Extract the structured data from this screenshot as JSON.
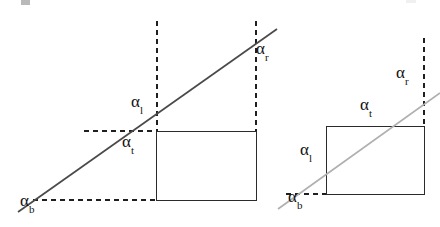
{
  "figure": {
    "background_color": "#ffffff",
    "stroke_color_dark": "#2b2b2b",
    "stroke_color_light": "#a8a8a8",
    "dash_color": "#1f1f1f",
    "label_color": "#121212",
    "alpha_glyph": "α",
    "subscripts": {
      "bottom": "b",
      "left": "l",
      "top": "t",
      "right": "r"
    },
    "panels": [
      {
        "id": "left-panel",
        "name": "line-misses-rectangle-case",
        "rectangle": {
          "x": 156,
          "y": 131,
          "width": 100,
          "height": 69
        },
        "ray": {
          "x1": 18,
          "y1": 212,
          "x2": 276,
          "y2": 30,
          "color": "#4a4a4a"
        },
        "dashed_lines": [
          {
            "name": "bottom-horizontal",
            "x1": 33,
            "y1": 200,
            "x2": 156,
            "y2": 200
          },
          {
            "name": "top-horizontal",
            "x1": 84,
            "y1": 131,
            "x2": 156,
            "y2": 131
          },
          {
            "name": "left-vertical",
            "x1": 157,
            "y1": 21,
            "x2": 157,
            "y2": 131
          },
          {
            "name": "right-vertical",
            "x1": 256,
            "y1": 21,
            "x2": 256,
            "y2": 131
          }
        ],
        "labels": [
          {
            "id": "left-alpha-b",
            "sub": "b",
            "x": 20,
            "y": 200
          },
          {
            "id": "left-alpha-l",
            "sub": "l",
            "x": 131,
            "y": 92
          },
          {
            "id": "left-alpha-t",
            "sub": "t",
            "x": 122,
            "y": 132
          },
          {
            "id": "left-alpha-r",
            "sub": "r",
            "x": 255,
            "y": 38
          }
        ]
      },
      {
        "id": "right-panel",
        "name": "line-crosses-rectangle-case",
        "rectangle": {
          "x": 326,
          "y": 126,
          "width": 98,
          "height": 68
        },
        "ray": {
          "x1": 278,
          "y1": 208,
          "x2": 440,
          "y2": 93,
          "color": "#b0b0b0"
        },
        "dashed_lines": [
          {
            "name": "bottom-horizontal",
            "x1": 288,
            "y1": 194,
            "x2": 326,
            "y2": 194
          },
          {
            "name": "right-vertical",
            "x1": 424,
            "y1": 38,
            "x2": 424,
            "y2": 126
          }
        ],
        "labels": [
          {
            "id": "right-alpha-b",
            "sub": "b",
            "x": 288,
            "y": 196
          },
          {
            "id": "right-alpha-l",
            "sub": "l",
            "x": 300,
            "y": 145
          },
          {
            "id": "right-alpha-t",
            "sub": "t",
            "x": 360,
            "y": 96
          },
          {
            "id": "right-alpha-r",
            "sub": "r",
            "x": 396,
            "y": 64
          }
        ]
      }
    ]
  }
}
